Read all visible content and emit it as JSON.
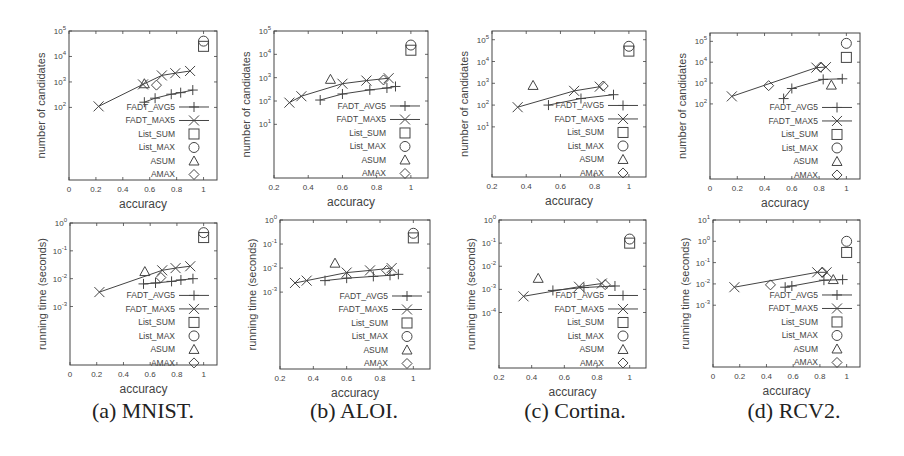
{
  "figure": {
    "captions": [
      "(a) MNIST.",
      "(b) ALOI.",
      "(c) Cortina.",
      "(d) RCV2."
    ],
    "legend": [
      {
        "label": "FADT_AVG5",
        "marker": "plus",
        "line": true
      },
      {
        "label": "FADT_MAX5",
        "marker": "cross",
        "line": true
      },
      {
        "label": "List_SUM",
        "marker": "square",
        "line": false
      },
      {
        "label": "List_MAX",
        "marker": "circle",
        "line": false
      },
      {
        "label": "ASUM",
        "marker": "triangle",
        "line": false
      },
      {
        "label": "AMAX",
        "marker": "diamond",
        "line": false
      }
    ],
    "colors": {
      "ink": "#444444",
      "axis": "#555555",
      "text": "#444444",
      "background": "#ffffff"
    }
  },
  "chart_data": [
    {
      "panel": "a-top",
      "dataset": "MNIST",
      "type": "scatter",
      "title": "",
      "xlabel": "accuracy",
      "ylabel": "number of candidates",
      "yscale": "log",
      "xlim": [
        0,
        1.1
      ],
      "ylim_exp": [
        -0.85,
        5
      ],
      "xticks": [
        0,
        0.2,
        0.4,
        0.6,
        0.8,
        1
      ],
      "xtick_labels": [
        "0",
        "0.2",
        "0.4",
        "0.6",
        "0.8",
        "1"
      ],
      "yticks_exp": [
        2,
        3,
        4,
        5
      ],
      "ytick_labels": [
        "10^2",
        "10^3",
        "10^4",
        "10^5"
      ],
      "rect": [
        69,
        31,
        148,
        149
      ],
      "series": [
        {
          "name": "FADT_AVG5",
          "x": [
            0.56,
            0.64,
            0.76,
            0.83,
            0.92
          ],
          "y": [
            160,
            230,
            330,
            380,
            480
          ]
        },
        {
          "name": "FADT_MAX5",
          "x": [
            0.22,
            0.55,
            0.69,
            0.79,
            0.9
          ],
          "y": [
            110,
            800,
            1800,
            2200,
            2700
          ]
        },
        {
          "name": "List_SUM",
          "x": [
            1.0
          ],
          "y": [
            25000
          ]
        },
        {
          "name": "List_MAX",
          "x": [
            1.0
          ],
          "y": [
            40000
          ]
        },
        {
          "name": "ASUM",
          "x": [
            0.56
          ],
          "y": [
            850
          ]
        },
        {
          "name": "AMAX",
          "x": [
            0.65
          ],
          "y": [
            750
          ]
        }
      ]
    },
    {
      "panel": "b-top",
      "dataset": "ALOI",
      "type": "scatter",
      "title": "",
      "xlabel": "accuracy",
      "ylabel": "number of candidates",
      "yscale": "log",
      "xlim": [
        0.2,
        1.1
      ],
      "ylim_exp": [
        -1.3,
        5
      ],
      "xticks": [
        0.2,
        0.4,
        0.6,
        0.8,
        1
      ],
      "xtick_labels": [
        "0.2",
        "0.4",
        "0.6",
        "0.8",
        "1"
      ],
      "yticks_exp": [
        1,
        2,
        3,
        4,
        5
      ],
      "ytick_labels": [
        "10^1",
        "10^2",
        "10^3",
        "10^4",
        "10^5"
      ],
      "rect": [
        274,
        31,
        154,
        147
      ],
      "series": [
        {
          "name": "FADT_AVG5",
          "x": [
            0.47,
            0.6,
            0.76,
            0.86,
            0.91
          ],
          "y": [
            110,
            200,
            300,
            360,
            420
          ]
        },
        {
          "name": "FADT_MAX5",
          "x": [
            0.29,
            0.36,
            0.6,
            0.74,
            0.87
          ],
          "y": [
            85,
            160,
            550,
            750,
            950
          ]
        },
        {
          "name": "List_SUM",
          "x": [
            1.0
          ],
          "y": [
            15000
          ]
        },
        {
          "name": "List_MAX",
          "x": [
            1.0
          ],
          "y": [
            25000
          ]
        },
        {
          "name": "ASUM",
          "x": [
            0.53
          ],
          "y": [
            850
          ]
        },
        {
          "name": "AMAX",
          "x": [
            0.84
          ],
          "y": [
            800
          ]
        }
      ]
    },
    {
      "panel": "c-top",
      "dataset": "Cortina",
      "type": "scatter",
      "title": "",
      "xlabel": "accuracy",
      "ylabel": "number of candidates",
      "yscale": "log",
      "xlim": [
        0.2,
        1.1
      ],
      "ylim_exp": [
        -1.3,
        5.4
      ],
      "xticks": [
        0.2,
        0.4,
        0.6,
        0.8,
        1
      ],
      "xtick_labels": [
        "0.2",
        "0.4",
        "0.6",
        "0.8",
        "1"
      ],
      "yticks_exp": [
        1,
        2,
        3,
        4,
        5
      ],
      "ytick_labels": [
        "10^1",
        "10^2",
        "10^3",
        "10^4",
        "10^5"
      ],
      "rect": [
        492,
        31,
        154,
        146
      ],
      "series": [
        {
          "name": "FADT_AVG5",
          "x": [
            0.53,
            0.72,
            0.91
          ],
          "y": [
            100,
            200,
            300
          ]
        },
        {
          "name": "FADT_MAX5",
          "x": [
            0.35,
            0.68,
            0.83
          ],
          "y": [
            80,
            450,
            700
          ]
        },
        {
          "name": "List_SUM",
          "x": [
            1.0
          ],
          "y": [
            30000
          ]
        },
        {
          "name": "List_MAX",
          "x": [
            1.0
          ],
          "y": [
            50000
          ]
        },
        {
          "name": "ASUM",
          "x": [
            0.44
          ],
          "y": [
            800
          ]
        },
        {
          "name": "AMAX",
          "x": [
            0.85
          ],
          "y": [
            750
          ]
        }
      ]
    },
    {
      "panel": "d-top",
      "dataset": "RCV2",
      "type": "scatter",
      "title": "",
      "xlabel": "accuracy",
      "ylabel": "number of candidates",
      "yscale": "log",
      "xlim": [
        0,
        1.1
      ],
      "ylim_exp": [
        -1.6,
        5.4
      ],
      "xticks": [
        0,
        0.2,
        0.4,
        0.6,
        0.8,
        1
      ],
      "xtick_labels": [
        "0",
        "0.2",
        "0.4",
        "0.6",
        "0.8",
        "1"
      ],
      "yticks_exp": [
        2,
        3,
        4,
        5
      ],
      "ytick_labels": [
        "10^2",
        "10^3",
        "10^4",
        "10^5"
      ],
      "rect": [
        710,
        33,
        150,
        146
      ],
      "series": [
        {
          "name": "FADT_AVG5",
          "x": [
            0.54,
            0.6,
            0.83,
            0.97
          ],
          "y": [
            180,
            550,
            1500,
            1600
          ]
        },
        {
          "name": "FADT_MAX5",
          "x": [
            0.16,
            0.78,
            0.85
          ],
          "y": [
            230,
            5500,
            5800
          ]
        },
        {
          "name": "List_SUM",
          "x": [
            1.0
          ],
          "y": [
            17000
          ]
        },
        {
          "name": "List_MAX",
          "x": [
            1.0
          ],
          "y": [
            80000
          ]
        },
        {
          "name": "ASUM",
          "x": [
            0.89
          ],
          "y": [
            800
          ]
        },
        {
          "name": "AMAX",
          "x": [
            0.43,
            0.81
          ],
          "y": [
            750,
            5800
          ]
        }
      ]
    },
    {
      "panel": "a-bottom",
      "dataset": "MNIST",
      "type": "scatter",
      "title": "",
      "xlabel": "accuracy",
      "ylabel": "running time (seconds)",
      "yscale": "log",
      "xlim": [
        0,
        1.1
      ],
      "ylim_exp": [
        -5.1,
        0
      ],
      "xticks": [
        0,
        0.2,
        0.4,
        0.6,
        0.8,
        1
      ],
      "xtick_labels": [
        "0",
        "0.2",
        "0.4",
        "0.6",
        "0.8",
        "1"
      ],
      "yticks_exp": [
        -3,
        -2,
        -1,
        0
      ],
      "ytick_labels": [
        "10^-3",
        "10^-2",
        "10^-1",
        "10^0"
      ],
      "rect": [
        70,
        223,
        147,
        142
      ],
      "series": [
        {
          "name": "FADT_AVG5",
          "x": [
            0.55,
            0.64,
            0.76,
            0.83,
            0.92
          ],
          "y": [
            0.0065,
            0.007,
            0.008,
            0.009,
            0.01
          ]
        },
        {
          "name": "FADT_MAX5",
          "x": [
            0.22,
            0.69,
            0.79,
            0.9
          ],
          "y": [
            0.0033,
            0.02,
            0.024,
            0.028
          ]
        },
        {
          "name": "List_SUM",
          "x": [
            1.0
          ],
          "y": [
            0.3
          ]
        },
        {
          "name": "List_MAX",
          "x": [
            1.0
          ],
          "y": [
            0.45
          ]
        },
        {
          "name": "ASUM",
          "x": [
            0.56
          ],
          "y": [
            0.018
          ]
        },
        {
          "name": "AMAX",
          "x": [
            0.68
          ],
          "y": [
            0.011
          ]
        }
      ]
    },
    {
      "panel": "b-bottom",
      "dataset": "ALOI",
      "type": "scatter",
      "title": "",
      "xlabel": "accuracy",
      "ylabel": "running time (seconds)",
      "yscale": "log",
      "xlim": [
        0.2,
        1.1
      ],
      "ylim_exp": [
        -6.2,
        0
      ],
      "xticks": [
        0.2,
        0.4,
        0.6,
        0.8,
        1
      ],
      "xtick_labels": [
        "0.2",
        "0.4",
        "0.6",
        "0.8",
        "1"
      ],
      "yticks_exp": [
        -3,
        -2,
        -1,
        0
      ],
      "ytick_labels": [
        "10^-3",
        "10^-2",
        "10^-1",
        "10^0"
      ],
      "rect": [
        280,
        220,
        150,
        149
      ],
      "series": [
        {
          "name": "FADT_AVG5",
          "x": [
            0.47,
            0.6,
            0.76,
            0.86,
            0.91
          ],
          "y": [
            0.003,
            0.0038,
            0.0045,
            0.005,
            0.0055
          ]
        },
        {
          "name": "FADT_MAX5",
          "x": [
            0.29,
            0.36,
            0.6,
            0.74,
            0.87
          ],
          "y": [
            0.0024,
            0.003,
            0.0065,
            0.008,
            0.01
          ]
        },
        {
          "name": "List_SUM",
          "x": [
            1.0
          ],
          "y": [
            0.18
          ]
        },
        {
          "name": "List_MAX",
          "x": [
            1.0
          ],
          "y": [
            0.28
          ]
        },
        {
          "name": "ASUM",
          "x": [
            0.53
          ],
          "y": [
            0.016
          ]
        },
        {
          "name": "AMAX",
          "x": [
            0.84
          ],
          "y": [
            0.008
          ]
        }
      ]
    },
    {
      "panel": "c-bottom",
      "dataset": "Cortina",
      "type": "scatter",
      "title": "",
      "xlabel": "accuracy",
      "ylabel": "running time (seconds)",
      "yscale": "log",
      "xlim": [
        0.2,
        1.1
      ],
      "ylim_exp": [
        -6.4,
        0
      ],
      "xticks": [
        0.2,
        0.4,
        0.6,
        0.8,
        1
      ],
      "xtick_labels": [
        "0.2",
        "0.4",
        "0.6",
        "0.8",
        "1"
      ],
      "yticks_exp": [
        -4,
        -3,
        -2,
        -1,
        0
      ],
      "ytick_labels": [
        "10^-4",
        "10^-3",
        "10^-2",
        "10^-1",
        "10^0"
      ],
      "rect": [
        499,
        220,
        147,
        148
      ],
      "series": [
        {
          "name": "FADT_AVG5",
          "x": [
            0.53,
            0.72,
            0.91
          ],
          "y": [
            0.0009,
            0.0012,
            0.0014
          ]
        },
        {
          "name": "FADT_MAX5",
          "x": [
            0.35,
            0.69,
            0.83
          ],
          "y": [
            0.0005,
            0.0013,
            0.0018
          ]
        },
        {
          "name": "List_SUM",
          "x": [
            1.0
          ],
          "y": [
            0.1
          ]
        },
        {
          "name": "List_MAX",
          "x": [
            1.0
          ],
          "y": [
            0.15
          ]
        },
        {
          "name": "ASUM",
          "x": [
            0.44
          ],
          "y": [
            0.003
          ]
        },
        {
          "name": "AMAX",
          "x": [
            0.85
          ],
          "y": [
            0.0016
          ]
        }
      ]
    },
    {
      "panel": "d-bottom",
      "dataset": "RCV2",
      "type": "scatter",
      "title": "",
      "xlabel": "accuracy",
      "ylabel": "running time (seconds)",
      "yscale": "log",
      "xlim": [
        0,
        1.1
      ],
      "ylim_exp": [
        -5.9,
        1
      ],
      "xticks": [
        0,
        0.2,
        0.4,
        0.6,
        0.8,
        1
      ],
      "xtick_labels": [
        "0",
        "0.2",
        "0.4",
        "0.6",
        "0.8",
        "1"
      ],
      "yticks_exp": [
        -3,
        -2,
        -1,
        0,
        1
      ],
      "ytick_labels": [
        "10^-3",
        "10^-2",
        "10^-1",
        "10^0",
        "10^1"
      ],
      "rect": [
        713,
        220,
        147,
        147
      ],
      "series": [
        {
          "name": "FADT_AVG5",
          "x": [
            0.54,
            0.59,
            0.83,
            0.97
          ],
          "y": [
            0.007,
            0.008,
            0.015,
            0.016
          ]
        },
        {
          "name": "FADT_MAX5",
          "x": [
            0.16,
            0.78,
            0.85
          ],
          "y": [
            0.007,
            0.035,
            0.035
          ]
        },
        {
          "name": "List_SUM",
          "x": [
            1.0
          ],
          "y": [
            0.3
          ]
        },
        {
          "name": "List_MAX",
          "x": [
            1.0
          ],
          "y": [
            1.0
          ]
        },
        {
          "name": "ASUM",
          "x": [
            0.9
          ],
          "y": [
            0.016
          ]
        },
        {
          "name": "AMAX",
          "x": [
            0.43,
            0.82
          ],
          "y": [
            0.009,
            0.035
          ]
        }
      ]
    }
  ]
}
